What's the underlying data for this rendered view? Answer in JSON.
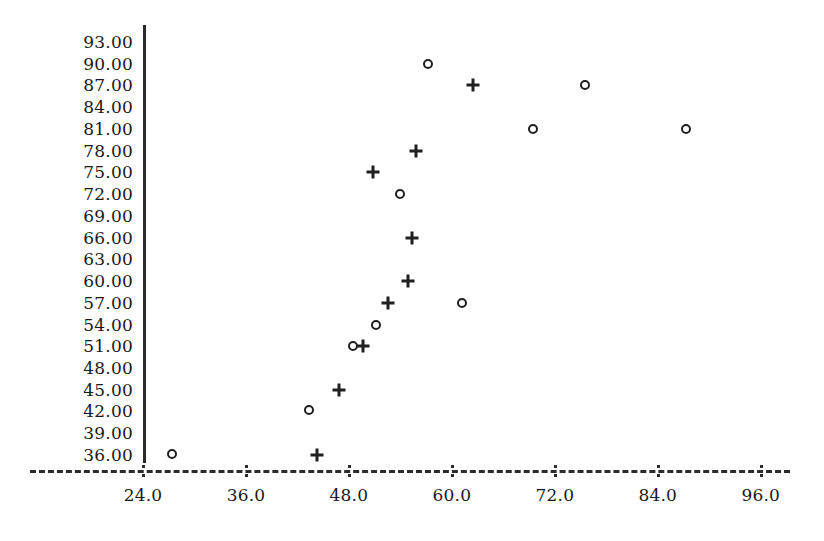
{
  "chart_data": {
    "type": "scatter",
    "title": "",
    "subtitle": "",
    "xlabel": "",
    "ylabel": "",
    "xlim": [
      24.0,
      96.0
    ],
    "ylim": [
      36.0,
      93.0
    ],
    "grid": false,
    "legend": "none",
    "x_ticks": [
      "24.0",
      "36.0",
      "48.0",
      "60.0",
      "72.0",
      "84.0",
      "96.0"
    ],
    "x_tick_values": [
      24,
      36,
      48,
      60,
      72,
      84,
      96
    ],
    "y_ticks": [
      "93.00",
      "90.00",
      "87.00",
      "84.00",
      "81.00",
      "78.00",
      "75.00",
      "72.00",
      "69.00",
      "66.00",
      "63.00",
      "60.00",
      "57.00",
      "54.00",
      "51.00",
      "48.00",
      "45.00",
      "42.00",
      "39.00",
      "36.00"
    ],
    "y_tick_values": [
      93,
      90,
      87,
      84,
      81,
      78,
      75,
      72,
      69,
      66,
      63,
      60,
      57,
      54,
      51,
      48,
      45,
      42,
      39,
      36
    ],
    "axis_style": {
      "y_axis": "solid-vertical-line",
      "x_axis": "dashed-line-with-colon-ticks",
      "marker_colors": "#1f1f1f"
    },
    "series": [
      {
        "name": "circle-series",
        "marker": "o",
        "points": [
          {
            "x": 27.4,
            "y": 36.2
          },
          {
            "x": 43.3,
            "y": 42.2
          },
          {
            "x": 48.5,
            "y": 51.0
          },
          {
            "x": 51.2,
            "y": 54.0
          },
          {
            "x": 54.0,
            "y": 72.0
          },
          {
            "x": 57.2,
            "y": 90.0
          },
          {
            "x": 61.2,
            "y": 57.0
          },
          {
            "x": 69.5,
            "y": 81.0
          },
          {
            "x": 75.5,
            "y": 87.0
          },
          {
            "x": 87.3,
            "y": 81.0
          }
        ]
      },
      {
        "name": "plus-series",
        "marker": "+",
        "points": [
          {
            "x": 44.3,
            "y": 36.0
          },
          {
            "x": 46.8,
            "y": 45.0
          },
          {
            "x": 49.6,
            "y": 51.0
          },
          {
            "x": 50.8,
            "y": 75.0
          },
          {
            "x": 52.5,
            "y": 57.0
          },
          {
            "x": 54.9,
            "y": 60.0
          },
          {
            "x": 55.3,
            "y": 66.0
          },
          {
            "x": 55.8,
            "y": 78.0
          },
          {
            "x": 62.5,
            "y": 87.0
          }
        ]
      }
    ]
  }
}
